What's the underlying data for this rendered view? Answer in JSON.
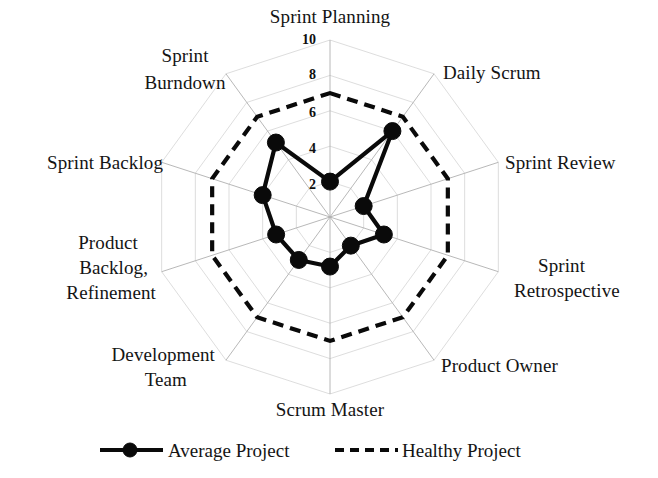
{
  "chart_data": {
    "type": "radar",
    "title": "",
    "subtitle": "",
    "xlabel": "",
    "ylabel": "",
    "grid": true,
    "legend_position": "bottom",
    "axis_min": 0,
    "axis_max": 10,
    "tick_labels": [
      "2",
      "4",
      "6",
      "8",
      "10"
    ],
    "tick_values": [
      2,
      4,
      6,
      8,
      10
    ],
    "tick_axis": "Sprint Planning",
    "categories": [
      "Sprint Planning",
      "Daily Scrum",
      "Sprint Review",
      "Sprint Retrospective",
      "Product Owner",
      "Scrum Master",
      "Development Team",
      "Product Backlog, Refinement",
      "Sprint Backlog",
      "Sprint Burndown"
    ],
    "category_label_lines": [
      [
        "Sprint Planning"
      ],
      [
        "Daily Scrum"
      ],
      [
        "Sprint Review"
      ],
      [
        "Sprint",
        "Retrospective"
      ],
      [
        "Product Owner"
      ],
      [
        "Scrum Master"
      ],
      [
        "Development",
        "Team"
      ],
      [
        "Product",
        "Backlog,",
        "Refinement"
      ],
      [
        "Sprint Backlog"
      ],
      [
        "Sprint",
        "Burndown"
      ]
    ],
    "series": [
      {
        "name": "Average Project",
        "style": "solid",
        "markers": true,
        "color": "#0a0a0a",
        "values": [
          2,
          6,
          2,
          3.2,
          2,
          2.8,
          3,
          3.2,
          4,
          5.2
        ]
      },
      {
        "name": "Healthy Project",
        "style": "dashed",
        "markers": false,
        "color": "#0a0a0a",
        "values": [
          7,
          7,
          7,
          7,
          7,
          7,
          7,
          7,
          7,
          7
        ]
      }
    ]
  },
  "legend": {
    "items": [
      {
        "label": "Average Project",
        "style": "solid-with-marker"
      },
      {
        "label": "Healthy Project",
        "style": "dashed"
      }
    ]
  },
  "axis_labels": {
    "sprint_planning": "Sprint Planning",
    "daily_scrum": "Daily Scrum",
    "sprint_review": "Sprint Review",
    "sprint_retrospective_l1": "Sprint",
    "sprint_retrospective_l2": "Retrospective",
    "product_owner": "Product Owner",
    "scrum_master": "Scrum Master",
    "development_team_l1": "Development",
    "development_team_l2": "Team",
    "product_backlog_l1": "Product",
    "product_backlog_l2": "Backlog,",
    "product_backlog_l3": "Refinement",
    "sprint_backlog": "Sprint Backlog",
    "sprint_burndown_l1": "Sprint",
    "sprint_burndown_l2": "Burndown"
  },
  "ticks": {
    "t10": "10",
    "t8": "8",
    "t6": "6",
    "t4": "4",
    "t2": "2"
  },
  "colors": {
    "series": "#0a0a0a",
    "grid": "#b9b9b9",
    "background": "#ffffff"
  }
}
